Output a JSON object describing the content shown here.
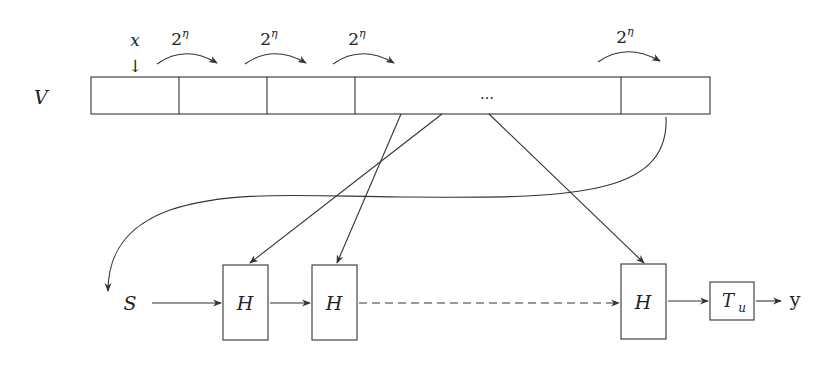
{
  "diagram": {
    "array": {
      "label": "V",
      "cells": [
        "",
        "",
        "",
        "…",
        ""
      ],
      "pointer_label": "x",
      "pointer_glyph": "↓",
      "jump_labels": [
        "2",
        "2",
        "2",
        "2"
      ],
      "jump_exponent": "η"
    },
    "pipeline": {
      "input_label": "S",
      "hash_blocks": [
        "H",
        "H",
        "H"
      ],
      "transform_label": "T",
      "transform_subscript": "u",
      "output_label": "y"
    }
  }
}
